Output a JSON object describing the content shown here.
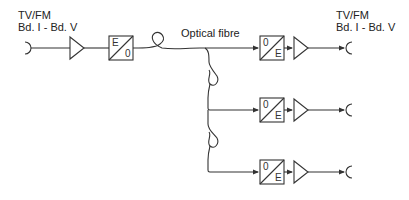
{
  "diagram": {
    "input_label": {
      "line1": "TV/FM",
      "line2": "Bd. I - Bd. V"
    },
    "output_label": {
      "line1": "TV/FM",
      "line2": "Bd. I - Bd. V"
    },
    "fibre_label": "Optical fibre",
    "transmitter": {
      "top": "E",
      "bottom": "0"
    },
    "receivers": [
      {
        "top": "0",
        "bottom": "E"
      },
      {
        "top": "0",
        "bottom": "E"
      },
      {
        "top": "0",
        "bottom": "E"
      }
    ],
    "colors": {
      "line": "#333333",
      "background": "#ffffff"
    }
  }
}
